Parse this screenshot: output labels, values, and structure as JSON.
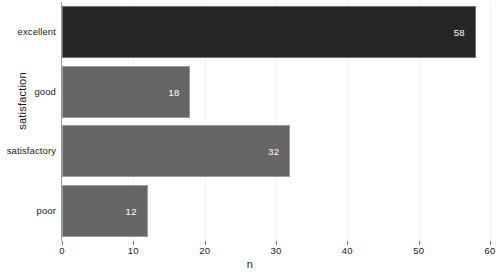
{
  "chart_data": {
    "type": "bar",
    "orientation": "horizontal",
    "title": "",
    "xlabel": "n",
    "ylabel": "satisfaction",
    "categories": [
      "excellent",
      "good",
      "satisfactory",
      "poor"
    ],
    "values": [
      58,
      18,
      32,
      12
    ],
    "data_labels": [
      "58",
      "18",
      "32",
      "12"
    ],
    "xlim": [
      0,
      60
    ],
    "xticks": [
      0,
      10,
      20,
      30,
      40,
      50,
      60
    ],
    "xtick_labels": [
      "0",
      "10",
      "20",
      "30",
      "40",
      "50",
      "60"
    ],
    "grid": false,
    "legend": false,
    "bar_colors": [
      "#262626",
      "#666666",
      "#666666",
      "#666666"
    ],
    "highlight_color": "#262626",
    "default_color": "#666666",
    "label_text_color": "#ffffff",
    "axis_color": "#999999",
    "background": "#ffffff"
  }
}
